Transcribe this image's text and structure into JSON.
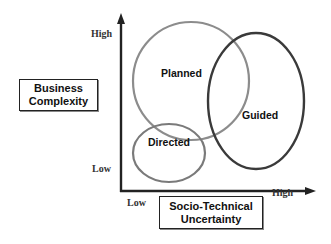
{
  "diagram": {
    "type": "overlapping-ellipses-on-2d-axes",
    "y_axis": {
      "title_line1": "Business",
      "title_line2": "Complexity",
      "high_label": "High",
      "low_label": "Low"
    },
    "x_axis": {
      "title_line1": "Socio-Technical",
      "title_line2": "Uncertainty",
      "low_label": "Low",
      "high_label": "High"
    },
    "regions": [
      {
        "id": "planned",
        "label": "Planned",
        "stroke": "#8c8c8c"
      },
      {
        "id": "guided",
        "label": "Guided",
        "stroke": "#3a3a3a"
      },
      {
        "id": "directed",
        "label": "Directed",
        "stroke": "#7a7a7a"
      }
    ],
    "axis_color": "#222222"
  }
}
